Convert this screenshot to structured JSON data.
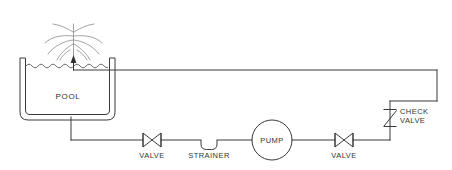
{
  "diagram": {
    "type": "process-flow-diagram",
    "background_color": "#ffffff",
    "line_color": "#3a3a3a",
    "labels": {
      "pool": "POOL",
      "valve_suction": "VALVE",
      "strainer": "STRAINER",
      "pump": "PUMP",
      "valve_discharge": "VALVE",
      "check_valve_line1": "CHECK",
      "check_valve_line2": "VALVE"
    },
    "components": [
      {
        "name": "pool",
        "label": "POOL",
        "symbol": "open-vessel",
        "x": 20,
        "y": 58
      },
      {
        "name": "fountain-spray",
        "label": "",
        "symbol": "spray-nozzle",
        "x": 73,
        "y": 20
      },
      {
        "name": "valve-suction",
        "label": "VALVE",
        "symbol": "gate-valve-bowtie",
        "x": 152,
        "y": 137
      },
      {
        "name": "strainer",
        "label": "STRAINER",
        "symbol": "u-strainer",
        "x": 209,
        "y": 137
      },
      {
        "name": "pump",
        "label": "PUMP",
        "symbol": "centrifugal-pump-circle",
        "x": 272,
        "y": 139
      },
      {
        "name": "valve-discharge",
        "label": "VALVE",
        "symbol": "gate-valve-bowtie",
        "x": 344,
        "y": 137
      },
      {
        "name": "check-valve",
        "label": "CHECK VALVE",
        "symbol": "swing-check-valve",
        "x": 390,
        "y": 118
      }
    ],
    "flow_path": [
      "pool-bottom-drain",
      "suction-line",
      "valve-suction",
      "strainer",
      "pump",
      "valve-discharge",
      "check-valve-riser",
      "return-header",
      "fountain-nozzle"
    ]
  }
}
